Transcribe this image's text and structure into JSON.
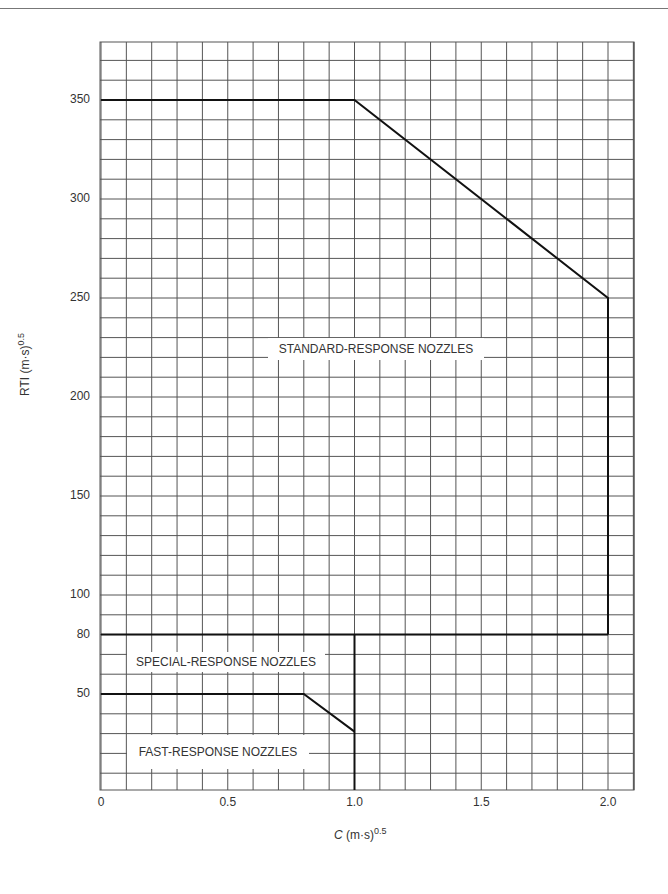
{
  "header": {
    "text": ""
  },
  "chart_data": {
    "type": "line",
    "title": "",
    "xlabel": "C (m·s)^0.5",
    "xlabel_main": "C",
    "xlabel_unit": " (m·s)",
    "xlabel_exp": "0.5",
    "ylabel": "RTI (m·s)^0.5",
    "ylabel_main": "RTI (m·s)",
    "ylabel_exp": "0.5",
    "xlim": [
      0,
      2.1
    ],
    "ylim": [
      0,
      380
    ],
    "grid": true,
    "grid_x_step": 0.1,
    "grid_y_step": 10,
    "x_ticks": [
      {
        "value": 0,
        "label": "0"
      },
      {
        "value": 0.5,
        "label": "0.5"
      },
      {
        "value": 1.0,
        "label": "1.0"
      },
      {
        "value": 1.5,
        "label": "1.5"
      },
      {
        "value": 2.0,
        "label": "2.0"
      }
    ],
    "y_ticks": [
      {
        "value": 50,
        "label": "50"
      },
      {
        "value": 80,
        "label": "80"
      },
      {
        "value": 100,
        "label": "100"
      },
      {
        "value": 150,
        "label": "150"
      },
      {
        "value": 200,
        "label": "200"
      },
      {
        "value": 250,
        "label": "250"
      },
      {
        "value": 300,
        "label": "300"
      },
      {
        "value": 350,
        "label": "350"
      }
    ],
    "series": [
      {
        "name": "Standard-response upper boundary",
        "x": [
          0,
          1.0,
          2.0,
          2.0
        ],
        "y": [
          350,
          350,
          250,
          80
        ]
      },
      {
        "name": "Special-response upper boundary",
        "x": [
          0,
          2.0
        ],
        "y": [
          80,
          80
        ]
      },
      {
        "name": "Fast-response upper boundary",
        "x": [
          0,
          0.8,
          1.0
        ],
        "y": [
          50,
          50,
          31
        ]
      },
      {
        "name": "C = 1.0 limit",
        "x": [
          1.0,
          1.0
        ],
        "y": [
          80,
          0
        ]
      }
    ],
    "annotations": [
      {
        "text": "STANDARD-RESPONSE NOZZLES",
        "x": 1.03,
        "y": 215
      },
      {
        "text": "SPECIAL-RESPONSE NOZZLES",
        "x": 0.45,
        "y": 65
      },
      {
        "text": "FAST-RESPONSE NOZZLES",
        "x": 0.45,
        "y": 33
      }
    ]
  }
}
